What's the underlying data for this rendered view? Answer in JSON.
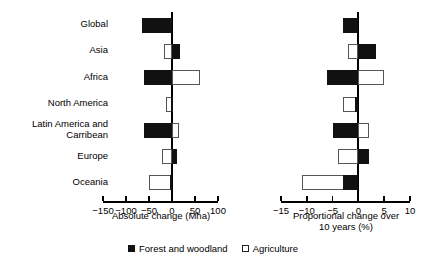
{
  "chart_data": {
    "type": "bar",
    "orientation": "horizontal",
    "title": "",
    "categories": [
      "Global",
      "Asia",
      "Africa",
      "North America",
      "Latin America and Carribean",
      "Europe",
      "Oceania"
    ],
    "legend": [
      {
        "name": "Forest and woodland",
        "color": "#111111",
        "fill": "solid"
      },
      {
        "name": "Agriculture",
        "color": "#ffffff",
        "fill": "open"
      }
    ],
    "legend_position": "bottom-center",
    "grid": false,
    "panels": [
      {
        "id": "absolute",
        "xlabel": "Absolute change (Mha)",
        "xlim": [
          -150,
          100
        ],
        "xticks": [
          -150,
          -100,
          -50,
          0,
          50,
          100
        ],
        "xticklabels": [
          "−150",
          "−100",
          "−50",
          "0",
          "50",
          "100"
        ],
        "series": [
          {
            "name": "Forest and woodland",
            "values": [
              -65,
              18,
              -60,
              -3,
              -60,
              10,
              -4
            ]
          },
          {
            "name": "Agriculture",
            "values": [
              -60,
              -18,
              60,
              -14,
              15,
              -22,
              -50
            ]
          }
        ]
      },
      {
        "id": "proportional",
        "xlabel": "Proportional change over\n10 years (%)",
        "xlim": [
          -15,
          10
        ],
        "xticks": [
          -15,
          -10,
          -5,
          0,
          5,
          10
        ],
        "xticklabels": [
          "−15",
          "−10",
          "−5",
          "0",
          "5",
          "10"
        ],
        "series": [
          {
            "name": "Forest and woodland",
            "values": [
              -3.0,
              3.5,
              -6.0,
              -0.6,
              -5.0,
              2.0,
              -3.0
            ]
          },
          {
            "name": "Agriculture",
            "values": [
              -1.5,
              -2.0,
              5.0,
              -3.0,
              2.0,
              -4.0,
              -11.0
            ]
          }
        ]
      }
    ]
  }
}
